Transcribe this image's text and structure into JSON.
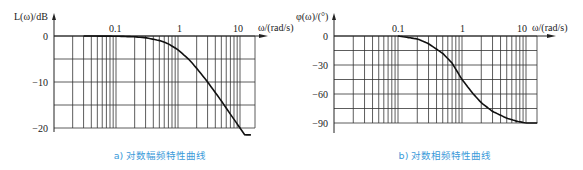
{
  "chart_data": [
    {
      "type": "line",
      "title": "",
      "caption": "a) 对数幅频特性曲线",
      "xlabel": "ω/(rad/s)",
      "ylabel": "L(ω)/dB",
      "xscale": "log",
      "xlim": [
        0.01,
        20
      ],
      "ylim": [
        -20,
        0
      ],
      "x_tick_labels": [
        "0.1",
        "1",
        "10"
      ],
      "y_tick_labels": [
        "0",
        "-10",
        "-20"
      ],
      "y_gridlines": [
        0,
        -5,
        -10,
        -15,
        -20
      ],
      "grid": true,
      "series": [
        {
          "name": "L(ω)",
          "x": [
            0.03,
            0.05,
            0.1,
            0.2,
            0.3,
            0.5,
            0.7,
            1,
            1.5,
            2,
            3,
            5,
            7,
            10,
            15
          ],
          "y": [
            0,
            -0.01,
            -0.04,
            -0.17,
            -0.37,
            -0.97,
            -1.7,
            -3.0,
            -5.1,
            -7.0,
            -10.0,
            -14.1,
            -17.0,
            -20.0,
            -23.5
          ]
        }
      ]
    },
    {
      "type": "line",
      "title": "",
      "caption": "b) 对数相频特性曲线",
      "xlabel": "ω/(rad/s)",
      "ylabel": "φ(ω)/(°)",
      "xscale": "log",
      "xlim": [
        0.01,
        20
      ],
      "ylim": [
        -90,
        0
      ],
      "x_tick_labels": [
        "0.1",
        "1",
        "10"
      ],
      "y_tick_labels": [
        "0",
        "-30",
        "-60",
        "-90"
      ],
      "y_gridlines": [
        0,
        -15,
        -30,
        -45,
        -60,
        -75,
        -90
      ],
      "grid": true,
      "series": [
        {
          "name": "φ(ω)",
          "x": [
            0.1,
            0.2,
            0.3,
            0.5,
            0.7,
            1,
            1.5,
            2,
            3,
            5,
            7,
            10,
            15
          ],
          "y": [
            0,
            -3,
            -8,
            -18,
            -28,
            -45,
            -60,
            -69,
            -78,
            -85,
            -88,
            -90,
            -90
          ]
        }
      ]
    }
  ],
  "charts": {
    "left": {
      "ylabel": "L(ω)/dB",
      "xlabel": "ω/(rad/s)",
      "caption": "a) 对数幅频特性曲线",
      "xticks": [
        "0.1",
        "1",
        "10"
      ],
      "yticks": [
        "0",
        "−10",
        "−20"
      ]
    },
    "right": {
      "ylabel": "φ(ω)/(°)",
      "xlabel": "ω/(rad/s)",
      "caption": "b) 对数相频特性曲线",
      "xticks": [
        "0.1",
        "1",
        "10"
      ],
      "yticks": [
        "0",
        "−30",
        "−60",
        "−90"
      ]
    }
  }
}
